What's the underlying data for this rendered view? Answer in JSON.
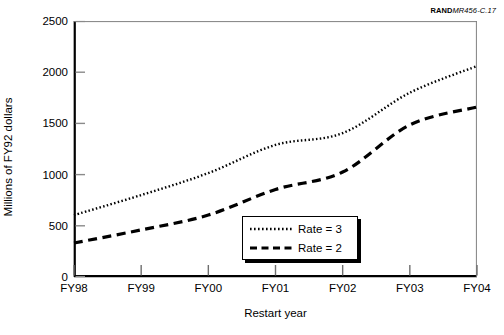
{
  "source_credit": {
    "mark": "RAND",
    "document": "MR456-C.17"
  },
  "chart_data": {
    "type": "line",
    "title": "",
    "xlabel": "Restart year",
    "ylabel": "Millions of FY92 dollars",
    "categories": [
      "FY98",
      "FY99",
      "FY00",
      "FY01",
      "FY02",
      "FY03",
      "FY04"
    ],
    "x_tick_labels": [
      "FY98",
      "FY99",
      "FY00",
      "FY01",
      "FY02",
      "FY03",
      "FY04"
    ],
    "y_tick_labels": [
      "0",
      "500",
      "1000",
      "1500",
      "2000",
      "2500"
    ],
    "y_ticks": [
      0,
      500,
      1000,
      1500,
      2000,
      2500
    ],
    "ylim": [
      0,
      2500
    ],
    "xlim": [
      0,
      6
    ],
    "grid": false,
    "legend_position": "inside-bottom-center",
    "series": [
      {
        "name": "Rate = 3",
        "style": "dotted",
        "color": "#000000",
        "values": [
          605,
          800,
          1015,
          1290,
          1405,
          1800,
          2060
        ]
      },
      {
        "name": "Rate = 2",
        "style": "dashed",
        "color": "#000000",
        "values": [
          332,
          460,
          605,
          855,
          1025,
          1485,
          1660
        ]
      }
    ],
    "legend": [
      {
        "label": "Rate = 3",
        "style": "dotted"
      },
      {
        "label": "Rate = 2",
        "style": "dashed"
      }
    ]
  }
}
